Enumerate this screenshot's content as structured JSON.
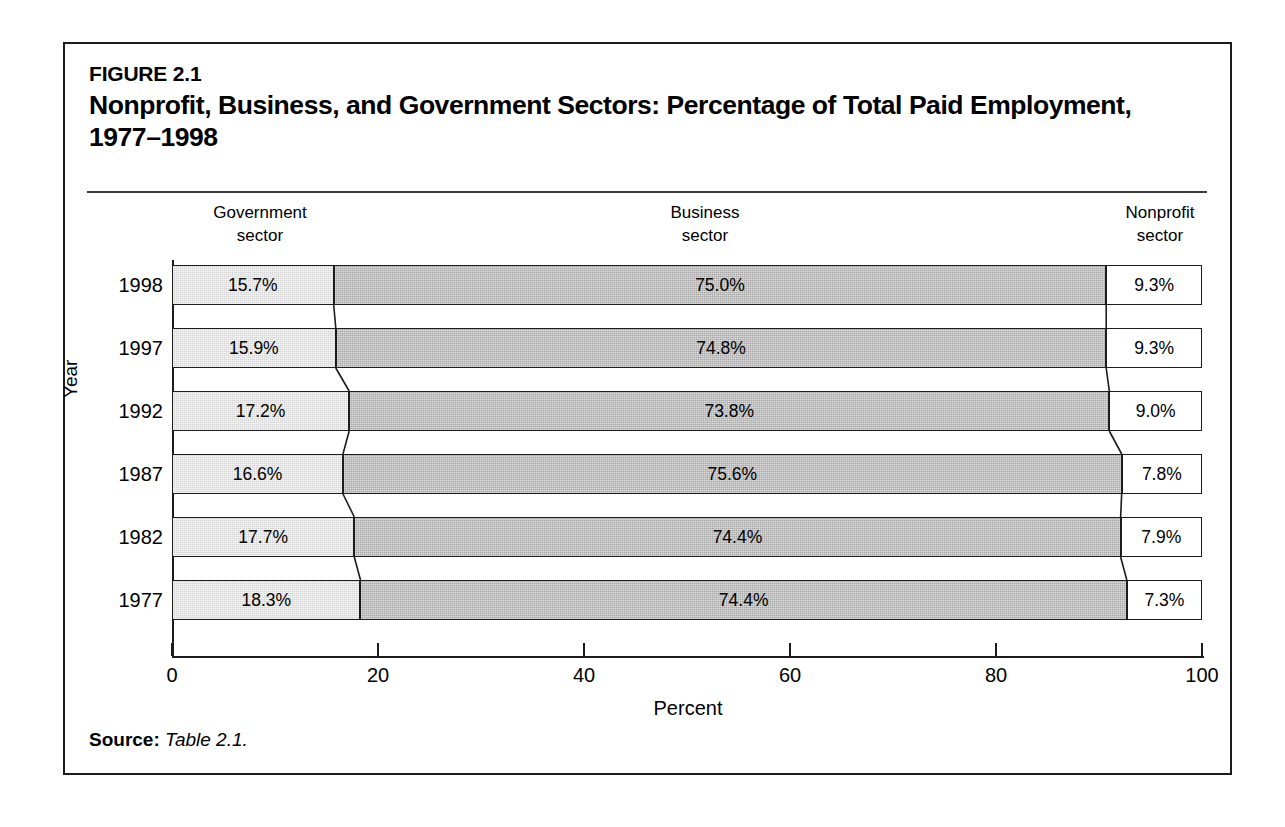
{
  "figure": {
    "number": "FIGURE 2.1",
    "title": "Nonprofit, Business, and Government Sectors: Percentage of Total Paid Employment, 1977–1998"
  },
  "source": {
    "label": "Source:",
    "value": "Table 2.1."
  },
  "headers": {
    "government": "Government\nsector",
    "business": "Business\nsector",
    "nonprofit": "Nonprofit\nsector"
  },
  "axis": {
    "x_title": "Percent",
    "y_title": "Year",
    "x_ticks": [
      "0",
      "20",
      "40",
      "60",
      "80",
      "100"
    ]
  },
  "colors": {
    "government": "#d4d4d4",
    "business": "#a9a9a9",
    "nonprofit": "#ffffff",
    "outline": "#1c1c1c",
    "frame": "#1c1c1c"
  },
  "chart_data": {
    "type": "bar",
    "subtype": "stacked-horizontal-100",
    "title": "Nonprofit, Business, and Government Sectors: Percentage of Total Paid Employment, 1977–1998",
    "xlabel": "Percent",
    "ylabel": "Year",
    "xlim": [
      0,
      100
    ],
    "xticks": [
      0,
      20,
      40,
      60,
      80,
      100
    ],
    "grid": false,
    "legend": "column-headers-above-plot",
    "categories": [
      "1998",
      "1997",
      "1992",
      "1987",
      "1982",
      "1977"
    ],
    "category_order": "top-to-bottom",
    "series": [
      {
        "name": "Government sector",
        "color": "#d4d4d4",
        "values": [
          15.7,
          15.9,
          17.2,
          16.6,
          17.7,
          18.3
        ],
        "labels": [
          "15.7%",
          "15.9%",
          "17.2%",
          "16.6%",
          "17.7%",
          "18.3%"
        ]
      },
      {
        "name": "Business sector",
        "color": "#a9a9a9",
        "values": [
          75.0,
          74.8,
          73.8,
          75.6,
          74.4,
          74.4
        ],
        "labels": [
          "75.0%",
          "74.8%",
          "73.8%",
          "75.6%",
          "74.4%",
          "74.4%"
        ]
      },
      {
        "name": "Nonprofit sector",
        "color": "#ffffff",
        "values": [
          9.3,
          9.3,
          9.0,
          7.8,
          7.9,
          7.3
        ],
        "labels": [
          "9.3%",
          "9.3%",
          "9.0%",
          "7.8%",
          "7.9%",
          "7.3%"
        ]
      }
    ]
  }
}
